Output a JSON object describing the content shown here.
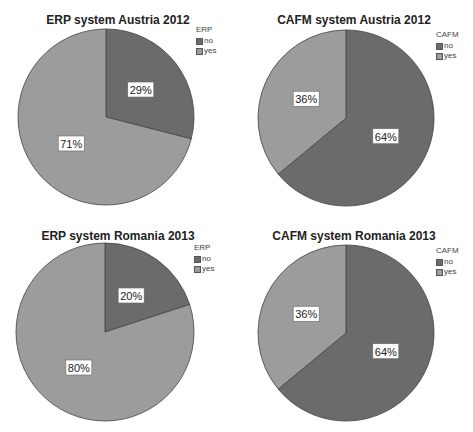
{
  "colors": {
    "no": "#6b6b6b",
    "yes": "#9c9c9c",
    "border": "#444444"
  },
  "charts": [
    {
      "title": "ERP system Austria 2012",
      "legend": {
        "title": "ERP",
        "items": [
          "no",
          "yes"
        ]
      },
      "slices": [
        {
          "label": "no",
          "value": 29,
          "text": "29%"
        },
        {
          "label": "yes",
          "value": 71,
          "text": "71%"
        }
      ]
    },
    {
      "title": "CAFM system Austria 2012",
      "legend": {
        "title": "CAFM",
        "items": [
          "no",
          "yes"
        ]
      },
      "slices": [
        {
          "label": "no",
          "value": 64,
          "text": "64%"
        },
        {
          "label": "yes",
          "value": 36,
          "text": "36%"
        }
      ]
    },
    {
      "title": "ERP system Romania 2013",
      "legend": {
        "title": "ERP",
        "items": [
          "no",
          "yes"
        ]
      },
      "slices": [
        {
          "label": "no",
          "value": 20,
          "text": "20%"
        },
        {
          "label": "yes",
          "value": 80,
          "text": "80%"
        }
      ]
    },
    {
      "title": "CAFM system Romania 2013",
      "legend": {
        "title": "CAFM",
        "items": [
          "no",
          "yes"
        ]
      },
      "slices": [
        {
          "label": "no",
          "value": 64,
          "text": "64%"
        },
        {
          "label": "yes",
          "value": 36,
          "text": "36%"
        }
      ]
    }
  ],
  "chart_data": [
    {
      "type": "pie",
      "title": "ERP system Austria 2012",
      "legend_title": "ERP",
      "categories": [
        "no",
        "yes"
      ],
      "values": [
        29,
        71
      ],
      "legend_position": "top-right"
    },
    {
      "type": "pie",
      "title": "CAFM system Austria 2012",
      "legend_title": "CAFM",
      "categories": [
        "no",
        "yes"
      ],
      "values": [
        64,
        36
      ],
      "legend_position": "top-right"
    },
    {
      "type": "pie",
      "title": "ERP system Romania 2013",
      "legend_title": "ERP",
      "categories": [
        "no",
        "yes"
      ],
      "values": [
        20,
        80
      ],
      "legend_position": "top-right"
    },
    {
      "type": "pie",
      "title": "CAFM system Romania 2013",
      "legend_title": "CAFM",
      "categories": [
        "no",
        "yes"
      ],
      "values": [
        64,
        36
      ],
      "legend_position": "top-right"
    }
  ]
}
